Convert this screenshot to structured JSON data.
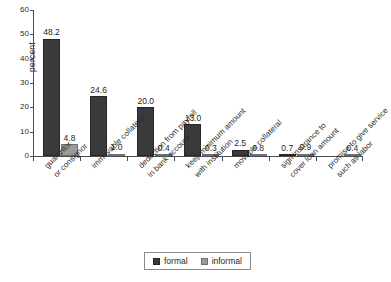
{
  "chart_data": {
    "type": "bar",
    "title": "",
    "xlabel": "",
    "ylabel": "percent",
    "ylim": [
      0,
      60
    ],
    "yticks": [
      "0",
      "10",
      "20",
      "30",
      "40",
      "50",
      "60"
    ],
    "grid": false,
    "legend_position": "bottom-center",
    "categories": [
      "guarantor or consignor",
      "immovable collateral",
      "deduction from payroll in bank account",
      "keep minimum amount with institution",
      "movable collateral",
      "sign insurance to cover loan amount",
      "promise to give service such as labor"
    ],
    "category_lines": [
      [
        "guarantor",
        "or consignor"
      ],
      [
        "immovable collateral"
      ],
      [
        "deduction from payroll",
        "in bank account"
      ],
      [
        "keep minimum amount",
        "with institution"
      ],
      [
        "movable collateral"
      ],
      [
        "sign insurance to",
        "cover loan amount"
      ],
      [
        "promise to give service",
        "such as labor"
      ]
    ],
    "series": [
      {
        "name": "formal",
        "color": "#3a3a3a",
        "values": [
          48.2,
          24.6,
          20.0,
          13.0,
          2.5,
          0.7,
          0.0
        ],
        "labels": [
          "48.2",
          "24.6",
          "20.0",
          "13.0",
          "2.5",
          "0.7",
          ""
        ]
      },
      {
        "name": "informal",
        "color": "#9a9a9a",
        "values": [
          4.8,
          1.0,
          0.4,
          0.3,
          0.8,
          0.9,
          0.4
        ],
        "labels": [
          "4.8",
          "1.0",
          "0.4",
          "0.3",
          "0.8",
          "0.9",
          "0.4"
        ]
      }
    ]
  },
  "legend": {
    "items": [
      {
        "label": "formal"
      },
      {
        "label": "informal"
      }
    ]
  }
}
